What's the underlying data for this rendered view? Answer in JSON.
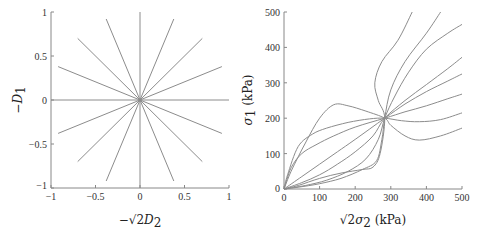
{
  "chart_data": [
    {
      "type": "line",
      "title": "",
      "xlabel": "−√2 D2",
      "ylabel": "−D1",
      "xlim": [
        -1,
        1
      ],
      "ylim": [
        -1,
        1
      ],
      "xticks": [
        "−1",
        "−0.5",
        "0",
        "0.5",
        "1"
      ],
      "yticks": [
        "1",
        "0.5",
        "0",
        "−0.5",
        "−1"
      ],
      "grid": false,
      "legend": null,
      "series_description": "16 straight rays from origin at 22.5° increments, length ≈1",
      "series": [
        {
          "name": "ray-0",
          "x": [
            0,
            1.0
          ],
          "y": [
            0,
            0.0
          ]
        },
        {
          "name": "ray-22.5",
          "x": [
            0,
            0.92
          ],
          "y": [
            0,
            0.38
          ]
        },
        {
          "name": "ray-45",
          "x": [
            0,
            0.7
          ],
          "y": [
            0,
            0.7
          ]
        },
        {
          "name": "ray-67.5",
          "x": [
            0,
            0.38
          ],
          "y": [
            0,
            0.92
          ]
        },
        {
          "name": "ray-90",
          "x": [
            0,
            0.0
          ],
          "y": [
            0,
            1.0
          ]
        },
        {
          "name": "ray-112.5",
          "x": [
            0,
            -0.38
          ],
          "y": [
            0,
            0.92
          ]
        },
        {
          "name": "ray-135",
          "x": [
            0,
            -0.7
          ],
          "y": [
            0,
            0.7
          ]
        },
        {
          "name": "ray-157.5",
          "x": [
            0,
            -0.92
          ],
          "y": [
            0,
            0.38
          ]
        },
        {
          "name": "ray-180",
          "x": [
            0,
            -1.0
          ],
          "y": [
            0,
            0.0
          ]
        },
        {
          "name": "ray-202.5",
          "x": [
            0,
            -0.92
          ],
          "y": [
            0,
            -0.38
          ]
        },
        {
          "name": "ray-225",
          "x": [
            0,
            -0.7
          ],
          "y": [
            0,
            -0.7
          ]
        },
        {
          "name": "ray-247.5",
          "x": [
            0,
            -0.38
          ],
          "y": [
            0,
            -0.92
          ]
        },
        {
          "name": "ray-270",
          "x": [
            0,
            0.0
          ],
          "y": [
            0,
            -1.0
          ]
        },
        {
          "name": "ray-292.5",
          "x": [
            0,
            0.38
          ],
          "y": [
            0,
            -0.92
          ]
        },
        {
          "name": "ray-315",
          "x": [
            0,
            0.7
          ],
          "y": [
            0,
            -0.7
          ]
        },
        {
          "name": "ray-337.5",
          "x": [
            0,
            0.92
          ],
          "y": [
            0,
            -0.38
          ]
        }
      ]
    },
    {
      "type": "line",
      "title": "",
      "xlabel": "√2σ2 (kPa)",
      "ylabel": "σ1 (kPa)",
      "xlim": [
        0,
        500
      ],
      "ylim": [
        0,
        500
      ],
      "xticks": [
        "0",
        "100",
        "200",
        "300",
        "400",
        "500"
      ],
      "yticks": [
        "500",
        "400",
        "300",
        "200",
        "100",
        "0"
      ],
      "grid": false,
      "legend": null,
      "annotations": [
        "all curves pass through (≈283, 200)"
      ],
      "series": [
        {
          "name": "path-1",
          "x": [
            0,
            20,
            60,
            100,
            140,
            180,
            230,
            283,
            300,
            340,
            380,
            440,
            500
          ],
          "y": [
            0,
            50,
            130,
            200,
            238,
            235,
            220,
            200,
            180,
            150,
            138,
            150,
            172
          ]
        },
        {
          "name": "path-2",
          "x": [
            0,
            10,
            40,
            80,
            120,
            180,
            240,
            283,
            330,
            380,
            440,
            500
          ],
          "y": [
            0,
            40,
            120,
            155,
            172,
            188,
            198,
            200,
            193,
            190,
            196,
            215
          ]
        },
        {
          "name": "path-3",
          "x": [
            0,
            20,
            50,
            90,
            140,
            200,
            283,
            340,
            400,
            460,
            500
          ],
          "y": [
            0,
            60,
            100,
            125,
            150,
            175,
            200,
            218,
            235,
            255,
            268
          ]
        },
        {
          "name": "path-4",
          "x": [
            0,
            50,
            100,
            150,
            200,
            283,
            340,
            400,
            460,
            500
          ],
          "y": [
            0,
            35,
            70,
            105,
            140,
            200,
            240,
            275,
            305,
            325
          ]
        },
        {
          "name": "path-5",
          "x": [
            0,
            50,
            100,
            150,
            200,
            250,
            283,
            340,
            400,
            460,
            500
          ],
          "y": [
            0,
            18,
            40,
            70,
            105,
            150,
            200,
            250,
            295,
            340,
            372
          ]
        },
        {
          "name": "path-6",
          "x": [
            0,
            60,
            120,
            180,
            230,
            265,
            283,
            310,
            350,
            400,
            460,
            500
          ],
          "y": [
            0,
            10,
            25,
            50,
            85,
            140,
            200,
            260,
            330,
            395,
            440,
            465
          ]
        },
        {
          "name": "path-7",
          "x": [
            0,
            40,
            100,
            160,
            220,
            260,
            275,
            283,
            300,
            340,
            400,
            440
          ],
          "y": [
            0,
            5,
            15,
            30,
            55,
            80,
            140,
            200,
            280,
            360,
            440,
            500
          ]
        },
        {
          "name": "path-8",
          "x": [
            0,
            40,
            100,
            160,
            220,
            250,
            270,
            283,
            265,
            255,
            275,
            320,
            360
          ],
          "y": [
            0,
            10,
            30,
            45,
            55,
            62,
            100,
            200,
            250,
            300,
            360,
            420,
            500
          ]
        }
      ]
    }
  ],
  "left": {
    "xticks": [
      "−1",
      "−0.5",
      "0",
      "0.5",
      "1"
    ],
    "yticks": [
      "1",
      "0.5",
      "0",
      "−0.5",
      "−1"
    ],
    "xlabel_prefix": "−√2",
    "xlabel_var": "D",
    "xlabel_sub": "2",
    "ylabel_var": "−D",
    "ylabel_sub": "1"
  },
  "right": {
    "xticks": [
      "0",
      "100",
      "200",
      "300",
      "400",
      "500"
    ],
    "yticks": [
      "500",
      "400",
      "300",
      "200",
      "100",
      "0"
    ],
    "xlabel_prefix": "√2",
    "xlabel_var": "σ",
    "xlabel_sub": "2",
    "xlabel_unit": " (kPa)",
    "ylabel_var": "σ",
    "ylabel_sub": "1",
    "ylabel_unit": " (kPa)"
  }
}
